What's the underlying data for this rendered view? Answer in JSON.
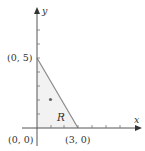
{
  "diagram": {
    "axes": {
      "x_label": "x",
      "y_label": "y",
      "x_ticks": [
        1,
        2,
        3,
        4,
        5,
        6
      ],
      "y_ticks": [
        1,
        2,
        3,
        4,
        5,
        6,
        7,
        8
      ]
    },
    "region": {
      "label": "R",
      "vertices": [
        [
          0,
          0
        ],
        [
          0,
          5
        ],
        [
          3,
          0
        ]
      ]
    },
    "points": [
      {
        "label": "(0, 5)",
        "x": 0,
        "y": 5
      },
      {
        "label": "(0, 0)",
        "x": 0,
        "y": 0
      },
      {
        "label": "(3, 0)",
        "x": 3,
        "y": 0
      }
    ],
    "marker": {
      "x": 1,
      "y": 2
    },
    "colors": {
      "axis": "#555555",
      "boundary": "#8a8a8a",
      "fill": "#f2f2f2",
      "marker": "#666666",
      "text": "#333333"
    }
  }
}
